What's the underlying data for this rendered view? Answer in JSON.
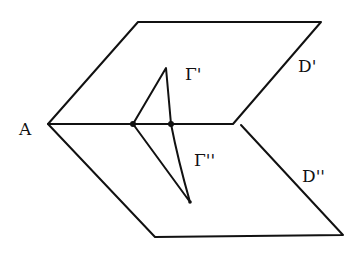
{
  "diagram": {
    "labels": {
      "vertex": "A",
      "curve_upper": "Γ'",
      "curve_lower": "Γ''",
      "plane_upper": "D'",
      "plane_lower": "D''"
    },
    "stroke_color": "#111111",
    "background": "#ffffff"
  }
}
